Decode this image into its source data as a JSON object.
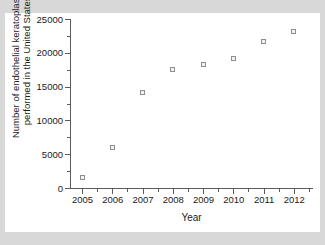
{
  "chart_data": {
    "type": "scatter",
    "title": "",
    "xlabel": "Year",
    "ylabel": "Number of endothelial keratoplasties performed in the United States",
    "ylabel_lines": [
      "Number of endothelial keratoplasties",
      "performed in the United States"
    ],
    "categories": [
      2005,
      2006,
      2007,
      2008,
      2009,
      2010,
      2011,
      2012
    ],
    "x": [
      2005,
      2006,
      2007,
      2008,
      2009,
      2010,
      2011,
      2012
    ],
    "values": [
      1500,
      6000,
      14200,
      17500,
      18200,
      19200,
      21600,
      23100
    ],
    "series": [
      {
        "name": "Endothelial keratoplasties",
        "values": [
          1500,
          6000,
          14200,
          17500,
          18200,
          19200,
          21600,
          23100
        ]
      }
    ],
    "xlim": [
      2004.6,
      2012.6
    ],
    "ylim": [
      0,
      25000
    ],
    "x_ticks": [
      2005,
      2006,
      2007,
      2008,
      2009,
      2010,
      2011,
      2012
    ],
    "x_tick_labels": [
      "2005",
      "2006",
      "2007",
      "2008",
      "2009",
      "2010",
      "2011",
      "2012"
    ],
    "y_ticks": [
      0,
      5000,
      10000,
      15000,
      20000,
      25000
    ],
    "y_tick_labels": [
      "0",
      "5000",
      "10000",
      "15000",
      "20000",
      "25000"
    ],
    "y_minor_ticks": [
      2500,
      7500,
      12500,
      17500,
      22500
    ],
    "grid": false,
    "legend": false,
    "marker": "open-square",
    "marker_color": "#8e8e8e",
    "axis_color": "#5a5a5a",
    "plot_background": "#ffffff",
    "figure_background": "#d8d8d8"
  }
}
